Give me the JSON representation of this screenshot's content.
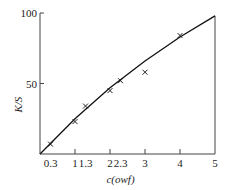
{
  "chart_data": {
    "type": "scatter",
    "title": "",
    "xlabel": "c(owf)",
    "ylabel": "K/S",
    "x_ticks": [
      "0.3",
      "1",
      "1.3",
      "2",
      "2.3",
      "3",
      "4",
      "5"
    ],
    "y_ticks": [
      "50",
      "100"
    ],
    "xlim": [
      0,
      5
    ],
    "ylim": [
      0,
      100
    ],
    "series": [
      {
        "name": "measured",
        "marker": "x",
        "x": [
          0.3,
          1,
          1.3,
          2,
          2.3,
          3,
          4
        ],
        "y": [
          7,
          23,
          34,
          45,
          52,
          58,
          84
        ]
      },
      {
        "name": "fit",
        "marker": "line",
        "x": [
          0,
          1,
          2,
          3,
          4,
          5
        ],
        "y": [
          0,
          25,
          47,
          66,
          83,
          98
        ]
      }
    ],
    "grid": false,
    "legend": "none"
  }
}
